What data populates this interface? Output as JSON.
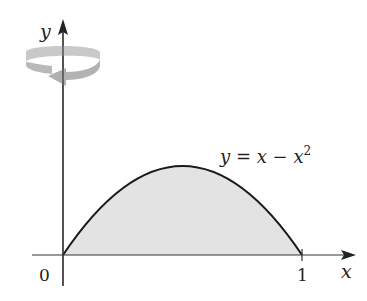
{
  "figure": {
    "type": "region-of-revolution",
    "equation_label": {
      "y": "y",
      "eq": " = ",
      "x1": "x",
      "minus": " − ",
      "x2": "x",
      "exp": "2"
    },
    "axes": {
      "x_label": "x",
      "y_label": "y",
      "origin_label": "0",
      "x_tick_label": "1"
    },
    "rotation_axis": "y",
    "colors": {
      "curve": "#1a1a1a",
      "fill": "#e3e3e3",
      "axis": "#333333",
      "rotation_arrow": "#b8b8b8"
    }
  }
}
